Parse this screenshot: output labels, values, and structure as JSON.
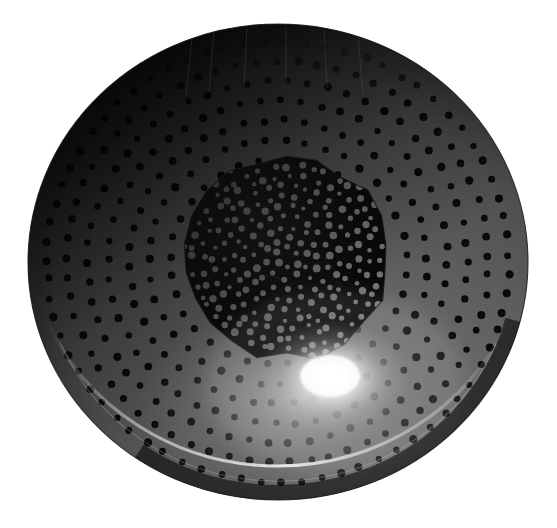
{
  "image": {
    "domain": "Natural-Image",
    "subject": "perforated metal bowl",
    "alt_text": "Top-down photograph of a dark perforated metal bowl (colander) on a white background",
    "width": 557,
    "height": 528,
    "background_color": "#ffffff"
  },
  "bowl": {
    "center_x": 278,
    "center_y": 262,
    "radius_x": 250,
    "radius_y": 238,
    "body_color": "#4e4e4e",
    "rim_shadow_color": "#050505",
    "rim_highlight_color": "#f2f2f2",
    "edge_stroke_color": "#1a1a1a"
  },
  "lighting": {
    "highlight_x": 332,
    "highlight_y": 378,
    "highlight_radius": 72,
    "highlight_color": "#ffffff",
    "shadow_origin": "top-left",
    "shadow_color": "#000000",
    "gradient_light_color": "#6a6a6a",
    "gradient_mid_color": "#3c3c3c",
    "gradient_dark_color": "#070707"
  },
  "inner_basin": {
    "center_x": 287,
    "center_y": 258,
    "radius_x": 103,
    "radius_y": 100,
    "fill_color": "#0a0a0a",
    "facet_count": 22,
    "facet_jitter": 0.055,
    "dot_color": "#8d8d8d",
    "dot_radius": 3.0,
    "dot_count": 520,
    "edge_color": "#141414"
  },
  "perforations": {
    "pattern": "concentric-radial-rings",
    "dot_color": "#090909",
    "dot_radius": 3.6,
    "ring_spacing": 20.5,
    "arc_spacing": 20.5,
    "first_ring_radius": 108,
    "last_ring_radius": 243,
    "ring_count": 7,
    "angular_jitter": 0.02,
    "radial_jitter": 1.6
  },
  "labels": {
    "title": "",
    "caption": ""
  }
}
